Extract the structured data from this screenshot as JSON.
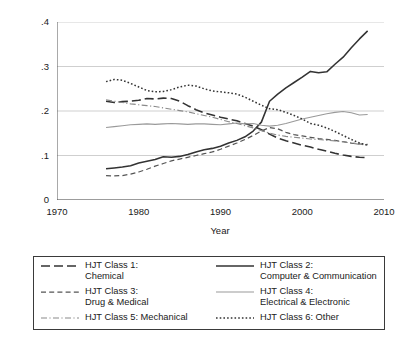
{
  "chart_data": {
    "type": "line",
    "title": "",
    "xlabel": "Year",
    "ylabel": "Fraction of all patents",
    "xlim": [
      1970,
      2010
    ],
    "ylim": [
      0,
      0.4
    ],
    "xticks": [
      "1970",
      "1980",
      "1990",
      "2000",
      "2010"
    ],
    "xtick_values": [
      1970,
      1980,
      1990,
      2000,
      2010
    ],
    "yticks": [
      "0",
      ".1",
      ".2",
      ".3",
      ".4"
    ],
    "ytick_values": [
      0,
      0.1,
      0.2,
      0.3,
      0.4
    ],
    "grid": "horizontal",
    "legend_position": "below-plot",
    "x": [
      1976,
      1977,
      1978,
      1979,
      1980,
      1981,
      1982,
      1983,
      1984,
      1985,
      1986,
      1987,
      1988,
      1989,
      1990,
      1991,
      1992,
      1993,
      1994,
      1995,
      1996,
      1997,
      1998,
      1999,
      2000,
      2001,
      2002,
      2003,
      2004,
      2005,
      2006,
      2007,
      2008
    ],
    "series": [
      {
        "name": "HJT Class 1: Chemical",
        "style": "long-dash",
        "color": "#333333",
        "values": [
          0.222,
          0.219,
          0.221,
          0.222,
          0.224,
          0.228,
          0.227,
          0.229,
          0.228,
          0.222,
          0.212,
          0.203,
          0.196,
          0.191,
          0.186,
          0.182,
          0.178,
          0.172,
          0.166,
          0.158,
          0.148,
          0.139,
          0.133,
          0.128,
          0.123,
          0.119,
          0.114,
          0.11,
          0.105,
          0.101,
          0.098,
          0.096,
          0.095
        ]
      },
      {
        "name": "HJT Class 2: Computer & Communication",
        "style": "solid",
        "color": "#333333",
        "values": [
          0.07,
          0.072,
          0.074,
          0.077,
          0.083,
          0.087,
          0.091,
          0.097,
          0.096,
          0.098,
          0.102,
          0.108,
          0.113,
          0.116,
          0.121,
          0.128,
          0.134,
          0.142,
          0.155,
          0.175,
          0.222,
          0.238,
          0.252,
          0.264,
          0.276,
          0.289,
          0.286,
          0.288,
          0.305,
          0.321,
          0.342,
          0.362,
          0.38
        ]
      },
      {
        "name": "HJT Class 3: Drug & Medical",
        "style": "medium-dash",
        "color": "#555555",
        "values": [
          0.055,
          0.054,
          0.055,
          0.058,
          0.063,
          0.069,
          0.076,
          0.082,
          0.088,
          0.092,
          0.096,
          0.1,
          0.104,
          0.108,
          0.114,
          0.121,
          0.128,
          0.136,
          0.145,
          0.155,
          0.163,
          0.16,
          0.152,
          0.147,
          0.144,
          0.141,
          0.138,
          0.136,
          0.134,
          0.131,
          0.128,
          0.126,
          0.125
        ]
      },
      {
        "name": "HJT Class 4: Electrical & Electronic",
        "style": "solid-light",
        "color": "#9a9a9a",
        "values": [
          0.163,
          0.165,
          0.167,
          0.169,
          0.17,
          0.171,
          0.17,
          0.171,
          0.172,
          0.171,
          0.17,
          0.171,
          0.171,
          0.17,
          0.169,
          0.171,
          0.173,
          0.171,
          0.172,
          0.168,
          0.166,
          0.168,
          0.172,
          0.177,
          0.182,
          0.186,
          0.19,
          0.194,
          0.197,
          0.199,
          0.196,
          0.191,
          0.192
        ]
      },
      {
        "name": "HJT Class 5: Mechanical",
        "style": "dash-dot",
        "color": "#8a8a8a",
        "values": [
          0.225,
          0.222,
          0.219,
          0.216,
          0.214,
          0.212,
          0.21,
          0.207,
          0.204,
          0.201,
          0.198,
          0.194,
          0.19,
          0.186,
          0.181,
          0.176,
          0.172,
          0.167,
          0.162,
          0.156,
          0.15,
          0.146,
          0.143,
          0.141,
          0.139,
          0.137,
          0.136,
          0.134,
          0.133,
          0.131,
          0.128,
          0.125,
          0.124
        ]
      },
      {
        "name": "HJT Class 6: Other",
        "style": "dotted",
        "color": "#333333",
        "values": [
          0.266,
          0.271,
          0.269,
          0.262,
          0.254,
          0.246,
          0.243,
          0.244,
          0.248,
          0.254,
          0.258,
          0.256,
          0.25,
          0.245,
          0.243,
          0.241,
          0.238,
          0.231,
          0.222,
          0.213,
          0.205,
          0.203,
          0.197,
          0.19,
          0.182,
          0.172,
          0.168,
          0.162,
          0.154,
          0.145,
          0.136,
          0.128,
          0.123
        ]
      }
    ]
  },
  "legend": {
    "entries": [
      {
        "id": "class-1",
        "icon": "long-dash-line-icon",
        "line1": "HJT Class 1:",
        "line2": "Chemical"
      },
      {
        "id": "class-2",
        "icon": "solid-line-icon",
        "line1": "HJT Class 2:",
        "line2": "Computer & Communication"
      },
      {
        "id": "class-3",
        "icon": "medium-dash-line-icon",
        "line1": "HJT Class 3:",
        "line2": "Drug & Medical"
      },
      {
        "id": "class-4",
        "icon": "solid-light-line-icon",
        "line1": "HJT Class 4:",
        "line2": "Electrical & Electronic"
      },
      {
        "id": "class-5",
        "icon": "dash-dot-line-icon",
        "line1": "HJT Class 5: Mechanical",
        "line2": ""
      },
      {
        "id": "class-6",
        "icon": "dotted-line-icon",
        "line1": "HJT Class 6: Other",
        "line2": ""
      }
    ]
  },
  "colors": {
    "dark": "#333333",
    "light": "#9a9a9a",
    "grid": "#c9c9c9",
    "axis": "#555555",
    "legend_border": "#3a3a3a"
  }
}
